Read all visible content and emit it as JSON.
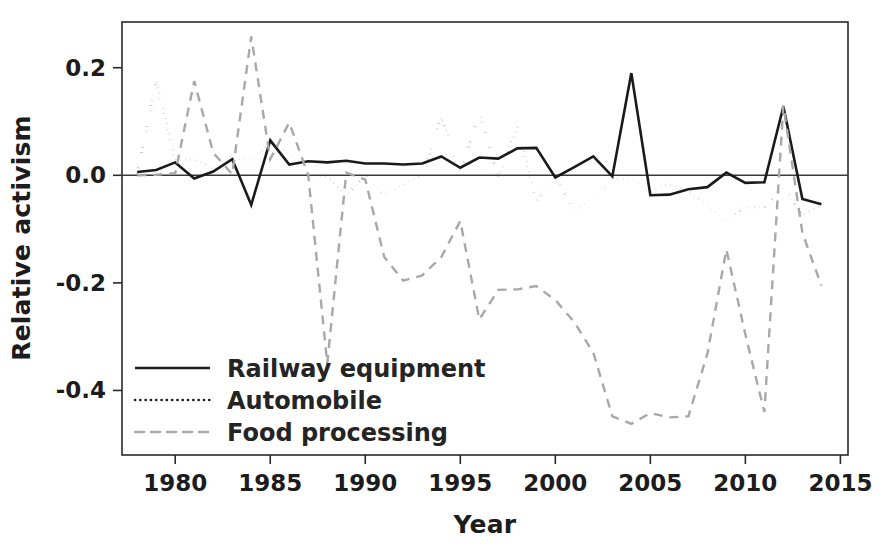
{
  "chart_data": {
    "type": "line",
    "title": "",
    "xlabel": "Year",
    "ylabel": "Relative activism",
    "xlim": [
      1977.2,
      2015.4
    ],
    "ylim": [
      -0.52,
      0.285
    ],
    "grid": false,
    "legend_position": "bottom-left-inside",
    "x_ticks": [
      1980,
      1985,
      1990,
      1995,
      2000,
      2005,
      2010,
      2015
    ],
    "x_tick_labels": [
      "1980",
      "1985",
      "1990",
      "1995",
      "2000",
      "2005",
      "2010",
      "2015"
    ],
    "y_ticks": [
      0.2,
      0.0,
      -0.2,
      -0.4
    ],
    "y_tick_labels": [
      "0.2",
      "0.0",
      "-0.2",
      "-0.4"
    ],
    "zero_line": 0.0,
    "x": [
      1978,
      1979,
      1980,
      1981,
      1982,
      1983,
      1984,
      1985,
      1986,
      1987,
      1988,
      1989,
      1990,
      1991,
      1992,
      1993,
      1994,
      1995,
      1996,
      1997,
      1998,
      1999,
      2000,
      2001,
      2002,
      2003,
      2004,
      2005,
      2006,
      2007,
      2008,
      2009,
      2010,
      2011,
      2012,
      2013,
      2014
    ],
    "series": [
      {
        "name": "Railway equipment",
        "style": "solid",
        "color": "#1a1a1a",
        "width": 2.6,
        "values": [
          0.006,
          0.01,
          0.024,
          -0.006,
          0.007,
          0.03,
          -0.055,
          0.065,
          0.02,
          0.026,
          0.024,
          0.027,
          0.022,
          0.022,
          0.02,
          0.022,
          0.035,
          0.014,
          0.033,
          0.031,
          0.05,
          0.051,
          -0.004,
          0.015,
          0.035,
          -0.002,
          0.19,
          -0.037,
          -0.036,
          -0.026,
          -0.022,
          0.005,
          -0.014,
          -0.013,
          0.128,
          -0.044,
          -0.054
        ]
      },
      {
        "name": "Automobile",
        "style": "dotted",
        "color": "#1a1a1a",
        "width": 2.6,
        "values": [
          0.004,
          0.175,
          0.028,
          0.03,
          0.013,
          0.032,
          0.028,
          0.06,
          0.04,
          0.0,
          -0.003,
          -0.038,
          0.0,
          -0.036,
          -0.017,
          0.0,
          0.108,
          0.002,
          0.118,
          -0.004,
          0.091,
          -0.048,
          -0.004,
          -0.066,
          -0.041,
          -0.008,
          -0.006,
          -0.03,
          -0.016,
          -0.03,
          -0.055,
          -0.086,
          -0.058,
          -0.06,
          -0.022,
          -0.074,
          -0.055
        ]
      },
      {
        "name": "Food processing",
        "style": "dashed",
        "color": "#a8a8a8",
        "width": 2.4,
        "values": [
          0.0,
          0.001,
          0.004,
          0.175,
          0.042,
          0.002,
          0.258,
          0.03,
          0.098,
          0.0,
          -0.35,
          0.005,
          -0.008,
          -0.152,
          -0.196,
          -0.186,
          -0.152,
          -0.085,
          -0.268,
          -0.213,
          -0.212,
          -0.206,
          -0.232,
          -0.273,
          -0.33,
          -0.448,
          -0.462,
          -0.442,
          -0.45,
          -0.448,
          -0.332,
          -0.138,
          -0.296,
          -0.44,
          0.13,
          -0.107,
          -0.205
        ]
      }
    ]
  },
  "legend": {
    "items": [
      {
        "label": "Railway equipment",
        "style": "solid"
      },
      {
        "label": "Automobile",
        "style": "dotted"
      },
      {
        "label": "Food processing",
        "style": "dashed"
      }
    ]
  }
}
